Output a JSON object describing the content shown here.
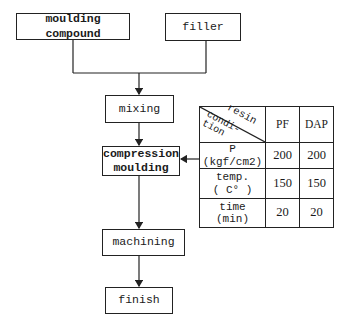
{
  "flowchart": {
    "inputs": [
      {
        "label": "moulding compound",
        "bold": true
      },
      {
        "label": "filler",
        "bold": false
      }
    ],
    "steps": [
      {
        "label": "mixing"
      },
      {
        "label_line1": "compression",
        "label_line2": "moulding",
        "bold": true
      },
      {
        "label": "machining"
      },
      {
        "label": "finish"
      }
    ]
  },
  "conditions_table": {
    "corner_top": "resin",
    "corner_bottom_line1": "condi-",
    "corner_bottom_line2": "tion",
    "columns": [
      "PF",
      "DAP"
    ],
    "rows": [
      {
        "label_line1": "P",
        "label_line2": "(kgf/cm2)",
        "PF": "200",
        "DAP": "200"
      },
      {
        "label_line1": "temp.",
        "label_line2": "( C° )",
        "PF": "150",
        "DAP": "150"
      },
      {
        "label_line1": "time",
        "label_line2": "(min)",
        "PF": "20",
        "DAP": "20"
      }
    ]
  }
}
